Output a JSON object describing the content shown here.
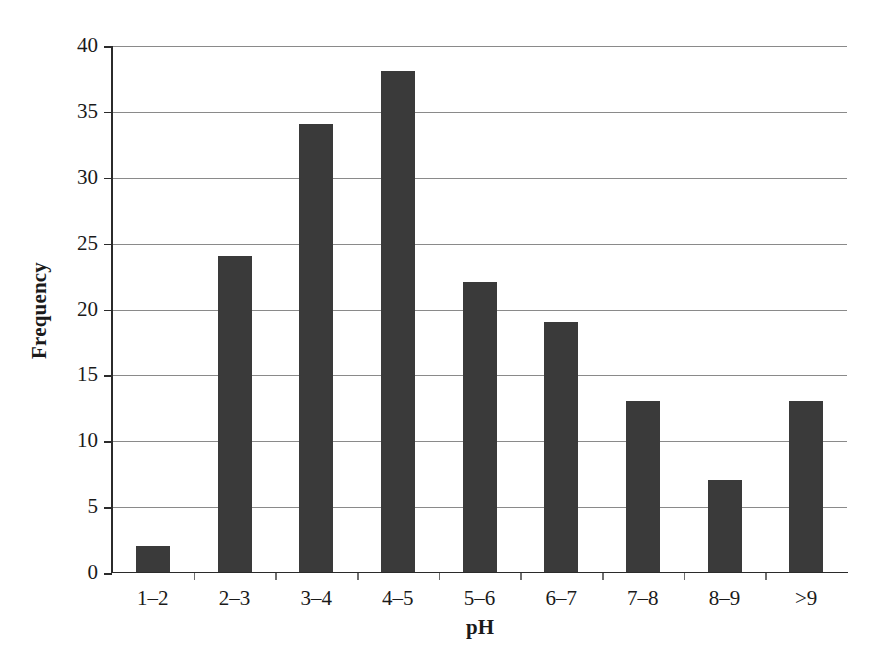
{
  "chart_data": {
    "type": "bar",
    "title": "",
    "subtitle": "",
    "xlabel": "pH",
    "ylabel": "Frequency",
    "categories": [
      "1–2",
      "2–3",
      "3–4",
      "4–5",
      "5–6",
      "6–7",
      "7–8",
      "8–9",
      ">9"
    ],
    "values": [
      2,
      24,
      34,
      38,
      22,
      19,
      13,
      7,
      13
    ],
    "ylim": [
      0,
      40
    ],
    "ytick_values": [
      0,
      5,
      10,
      15,
      20,
      25,
      30,
      35,
      40
    ],
    "ytick_labels": [
      "0",
      "5",
      "10",
      "15",
      "20",
      "25",
      "30",
      "35",
      "40"
    ],
    "grid": "horizontal",
    "legend": "none",
    "bar_color": "#3a3a3a",
    "grid_color": "#8a8a8a",
    "axis_color": "#2b2b2b",
    "background_color": "#ffffff"
  }
}
